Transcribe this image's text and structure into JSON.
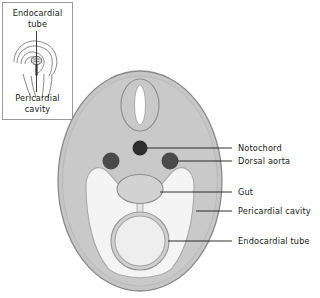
{
  "figure": {
    "colors": {
      "body_fill": "#c6c6c6",
      "body_stroke": "#8a8a8a",
      "cavity_fill": "#f4f4f4",
      "cavity_stroke": "#a8a8a8",
      "gut_fill": "#d2d2d2",
      "gut_stroke": "#8f8f8f",
      "neural_tube_fill": "#c9c9c9",
      "neural_tube_stroke": "#909090",
      "neural_canal_fill": "#ffffff",
      "notochord_fill": "#2e2e2e",
      "dorsal_aorta_fill": "#4a4a4a",
      "endocardial_ring_fill": "#cfcfcf",
      "endocardial_lumen_fill": "#eeeeee",
      "leader_line": "#1a1a1a",
      "label_text": "#1a1a1a",
      "inset_border": "#9a9a9a",
      "inset_line": "#6a6a6a",
      "background": "#ffffff"
    }
  },
  "inset": {
    "name": "embryo-folding-inset",
    "top_label": "Endocardial tube",
    "bottom_label": "Pericardial cavity"
  },
  "labels": [
    {
      "id": "notochord",
      "text": "Notochord"
    },
    {
      "id": "dorsal-aorta",
      "text": "Dorsal aorta"
    },
    {
      "id": "gut",
      "text": "Gut"
    },
    {
      "id": "pericardial-cavity",
      "text": "Pericardial cavity"
    },
    {
      "id": "endocardial-tube",
      "text": "Endocardial tube"
    }
  ],
  "structures": [
    {
      "id": "neural-tube",
      "name": "Neural tube"
    },
    {
      "id": "notochord",
      "name": "Notochord"
    },
    {
      "id": "dorsal-aorta-left",
      "name": "Dorsal aorta (left)"
    },
    {
      "id": "dorsal-aorta-right",
      "name": "Dorsal aorta (right)"
    },
    {
      "id": "gut",
      "name": "Gut"
    },
    {
      "id": "pericardial-cavity",
      "name": "Pericardial cavity"
    },
    {
      "id": "endocardial-tube",
      "name": "Endocardial tube"
    },
    {
      "id": "dorsal-mesocardium",
      "name": "Dorsal mesocardium"
    }
  ]
}
